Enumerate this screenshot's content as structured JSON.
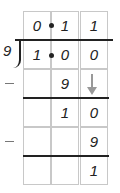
{
  "problem": {
    "divisor": "9",
    "dividend": [
      "1",
      "0",
      "0"
    ],
    "quotient": [
      "0",
      "1",
      "1"
    ],
    "decimal_marker": "•"
  },
  "rows": [
    {
      "cells": [
        "0",
        "1",
        "1"
      ],
      "role": "quotient"
    },
    {
      "cells": [
        "1",
        "0",
        "0"
      ],
      "role": "dividend"
    },
    {
      "cells": [
        "",
        "9",
        ""
      ],
      "role": "subtract",
      "sign": "–",
      "bring_down_arrow_col": 2
    },
    {
      "cells": [
        "",
        "1",
        "0"
      ],
      "role": "remainder"
    },
    {
      "cells": [
        "",
        "",
        "9"
      ],
      "role": "subtract",
      "sign": "–"
    },
    {
      "cells": [
        "",
        "",
        "1"
      ],
      "role": "remainder"
    }
  ]
}
